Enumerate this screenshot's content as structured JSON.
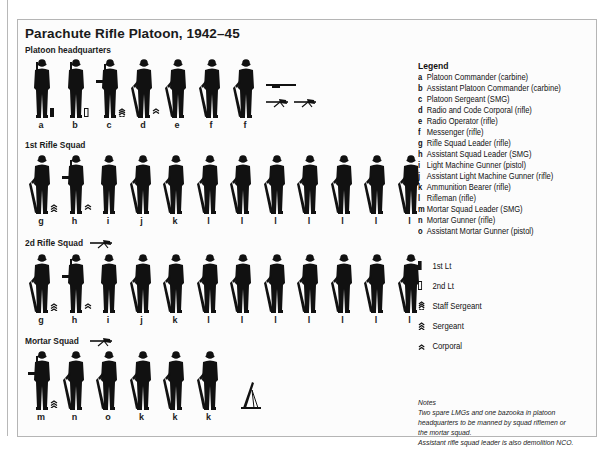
{
  "title": "Parachute Rifle Platoon, 1942–45",
  "sections": {
    "hq": {
      "label": "Platoon headquarters",
      "figures": [
        {
          "code": "a",
          "pose": "carbine",
          "rank": "1st-lt"
        },
        {
          "code": "b",
          "pose": "carbine",
          "rank": "2nd-lt"
        },
        {
          "code": "c",
          "pose": "smg",
          "rank": "staff-sergeant"
        },
        {
          "code": "d",
          "pose": "rifle",
          "rank": "corporal"
        },
        {
          "code": "e",
          "pose": "rifle",
          "rank": ""
        },
        {
          "code": "f",
          "pose": "rifle",
          "rank": ""
        },
        {
          "code": "f",
          "pose": "rifle",
          "rank": ""
        }
      ],
      "extra_weapons": [
        "bazooka-icon",
        "light-machine-gun-icon",
        "light-machine-gun-icon"
      ]
    },
    "squad1": {
      "label": "1st Rifle Squad",
      "figures": [
        {
          "code": "g",
          "pose": "rifle",
          "rank": "sergeant"
        },
        {
          "code": "h",
          "pose": "smg",
          "rank": "corporal"
        },
        {
          "code": "i",
          "pose": "pistol",
          "rank": ""
        },
        {
          "code": "j",
          "pose": "rifle",
          "rank": ""
        },
        {
          "code": "k",
          "pose": "rifle",
          "rank": ""
        },
        {
          "code": "l",
          "pose": "rifle",
          "rank": ""
        },
        {
          "code": "l",
          "pose": "rifle",
          "rank": ""
        },
        {
          "code": "l",
          "pose": "rifle",
          "rank": ""
        },
        {
          "code": "l",
          "pose": "rifle",
          "rank": ""
        },
        {
          "code": "l",
          "pose": "rifle",
          "rank": ""
        },
        {
          "code": "l",
          "pose": "rifle",
          "rank": ""
        },
        {
          "code": "l",
          "pose": "rifle",
          "rank": ""
        }
      ]
    },
    "squad2": {
      "label": "2d Rifle Squad",
      "section_weapon": "light-machine-gun-icon",
      "figures": [
        {
          "code": "g",
          "pose": "rifle",
          "rank": "sergeant"
        },
        {
          "code": "h",
          "pose": "smg",
          "rank": "corporal"
        },
        {
          "code": "i",
          "pose": "pistol",
          "rank": ""
        },
        {
          "code": "j",
          "pose": "rifle",
          "rank": ""
        },
        {
          "code": "k",
          "pose": "rifle",
          "rank": ""
        },
        {
          "code": "l",
          "pose": "rifle",
          "rank": ""
        },
        {
          "code": "l",
          "pose": "rifle",
          "rank": ""
        },
        {
          "code": "l",
          "pose": "rifle",
          "rank": ""
        },
        {
          "code": "l",
          "pose": "rifle",
          "rank": ""
        },
        {
          "code": "l",
          "pose": "rifle",
          "rank": ""
        },
        {
          "code": "l",
          "pose": "rifle",
          "rank": ""
        },
        {
          "code": "l",
          "pose": "rifle",
          "rank": ""
        }
      ]
    },
    "mortar": {
      "label": "Mortar Squad",
      "section_weapon": "light-machine-gun-icon",
      "figures": [
        {
          "code": "m",
          "pose": "smg",
          "rank": "sergeant"
        },
        {
          "code": "n",
          "pose": "rifle",
          "rank": ""
        },
        {
          "code": "o",
          "pose": "rifle",
          "rank": ""
        },
        {
          "code": "k",
          "pose": "rifle",
          "rank": ""
        },
        {
          "code": "k",
          "pose": "rifle",
          "rank": ""
        },
        {
          "code": "k",
          "pose": "rifle",
          "rank": ""
        }
      ],
      "extra_weapons": [
        "mortar-icon"
      ]
    }
  },
  "legend": {
    "title": "Legend",
    "items": [
      {
        "code": "a",
        "text": "Platoon Commander (carbine)"
      },
      {
        "code": "b",
        "text": "Assistant Platoon Commander (carbine)"
      },
      {
        "code": "c",
        "text": "Platoon Sergeant (SMG)"
      },
      {
        "code": "d",
        "text": "Radio and Code Corporal (rifle)"
      },
      {
        "code": "e",
        "text": "Radio Operator (rifle)"
      },
      {
        "code": "f",
        "text": "Messenger (rifle)"
      },
      {
        "code": "g",
        "text": "Rifle Squad Leader (rifle)"
      },
      {
        "code": "h",
        "text": "Assistant Squad Leader (SMG)"
      },
      {
        "code": "i",
        "text": "Light Machine Gunner (pistol)"
      },
      {
        "code": "j",
        "text": "Assistant Light Machine Gunner (rifle)"
      },
      {
        "code": "k",
        "text": "Ammunition Bearer (rifle)"
      },
      {
        "code": "l",
        "text": "Rifleman (rifle)"
      },
      {
        "code": "m",
        "text": "Mortar Squad Leader (SMG)"
      },
      {
        "code": "n",
        "text": "Mortar Gunner (rifle)"
      },
      {
        "code": "o",
        "text": "Assistant Mortar Gunner (pistol)"
      }
    ]
  },
  "ranks": [
    {
      "icon": "1st-lt",
      "text": "1st Lt"
    },
    {
      "icon": "2nd-lt",
      "text": "2nd Lt"
    },
    {
      "icon": "staff-sergeant",
      "text": "Staff Sergeant"
    },
    {
      "icon": "sergeant",
      "text": "Sergeant"
    },
    {
      "icon": "corporal",
      "text": "Corporal"
    }
  ],
  "notes": {
    "title": "Notes",
    "lines": [
      "Two spare LMGs and one bazooka in platoon",
      "headquarters to be manned by squad riflemen or",
      "the mortar squad.",
      "Assistant rifle squad leader is also demolition NCO."
    ]
  },
  "colors": {
    "ink": "#111111",
    "frame": "#b5b5b5",
    "background": "#fcfcfc"
  }
}
